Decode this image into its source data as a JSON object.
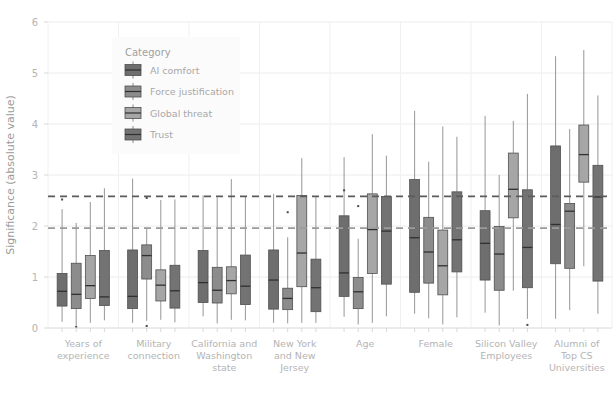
{
  "chart_data": {
    "type": "box",
    "title": "",
    "xlabel": "",
    "ylabel": "Significance (absolute value)",
    "ylim": [
      0,
      6
    ],
    "yticks": [
      0,
      1,
      2,
      3,
      4,
      5,
      6
    ],
    "ytick_labels": [
      "0",
      "1",
      "2",
      "3",
      "4",
      "5",
      "6"
    ],
    "grid": "horizontal-and-vertical-light",
    "legend_position": "upper-left-inside",
    "legend_title": "Category",
    "reference_lines": [
      {
        "value": 2.58,
        "style": "dashed",
        "color": "#5b5b5b",
        "label": ""
      },
      {
        "value": 1.96,
        "style": "dashed",
        "color": "#9a9a9a",
        "label": ""
      }
    ],
    "categories": [
      "Years of experience",
      "Military connection",
      "California and Washington state",
      "New York and New Jersey",
      "Age",
      "Female",
      "Silicon Valley Employees",
      "Alumni of Top CS Universities"
    ],
    "category_label_lines": [
      [
        "Years of",
        "experience"
      ],
      [
        "Military",
        "connection"
      ],
      [
        "California and",
        "Washington",
        "state"
      ],
      [
        "New York",
        "and New",
        "Jersey"
      ],
      [
        "Age"
      ],
      [
        "Female"
      ],
      [
        "Silicon Valley",
        "Employees"
      ],
      [
        "Alumni of",
        "Top CS",
        "Universities"
      ]
    ],
    "series": [
      {
        "name": "AI comfort",
        "color": "#6e6e6e",
        "boxes": [
          {
            "low": 0.12,
            "q1": 0.43,
            "med": 0.72,
            "q3": 1.07,
            "high": 2.33,
            "outliers": [
              2.52
            ]
          },
          {
            "low": 0.1,
            "q1": 0.38,
            "med": 0.62,
            "q3": 1.53,
            "high": 2.93,
            "outliers": []
          },
          {
            "low": 0.23,
            "q1": 0.5,
            "med": 0.89,
            "q3": 1.52,
            "high": 2.6,
            "outliers": []
          },
          {
            "low": 0.1,
            "q1": 0.37,
            "med": 0.94,
            "q3": 1.53,
            "high": 2.63,
            "outliers": []
          },
          {
            "low": 0.22,
            "q1": 0.62,
            "med": 1.08,
            "q3": 2.2,
            "high": 3.35,
            "outliers": [
              2.7
            ]
          },
          {
            "low": 0.28,
            "q1": 0.7,
            "med": 1.77,
            "q3": 2.91,
            "high": 4.26,
            "outliers": []
          },
          {
            "low": 0.3,
            "q1": 0.94,
            "med": 1.66,
            "q3": 2.3,
            "high": 4.16,
            "outliers": []
          },
          {
            "low": 0.18,
            "q1": 1.26,
            "med": 2.03,
            "q3": 3.57,
            "high": 5.33,
            "outliers": []
          }
        ]
      },
      {
        "name": "Force justification",
        "color": "#8c8c8c",
        "boxes": [
          {
            "low": 0.04,
            "q1": 0.38,
            "med": 0.66,
            "q3": 1.27,
            "high": 2.06,
            "outliers": [
              0.02
            ]
          },
          {
            "low": 0.14,
            "q1": 0.96,
            "med": 1.42,
            "q3": 1.63,
            "high": 1.96,
            "outliers": [
              2.55,
              0.04
            ]
          },
          {
            "low": 0.09,
            "q1": 0.49,
            "med": 0.74,
            "q3": 1.19,
            "high": 2.56,
            "outliers": []
          },
          {
            "low": 0.09,
            "q1": 0.36,
            "med": 0.58,
            "q3": 0.78,
            "high": 1.78,
            "outliers": [
              2.27
            ]
          },
          {
            "low": 0.07,
            "q1": 0.38,
            "med": 0.71,
            "q3": 0.99,
            "high": 1.75,
            "outliers": [
              2.39
            ]
          },
          {
            "low": 0.19,
            "q1": 0.88,
            "med": 1.49,
            "q3": 2.17,
            "high": 3.26,
            "outliers": []
          },
          {
            "low": 0.05,
            "q1": 0.74,
            "med": 1.45,
            "q3": 1.99,
            "high": 3.0,
            "outliers": []
          },
          {
            "low": 0.35,
            "q1": 1.17,
            "med": 2.29,
            "q3": 2.44,
            "high": 3.9,
            "outliers": []
          }
        ]
      },
      {
        "name": "Global threat",
        "color": "#a6a6a6",
        "boxes": [
          {
            "low": 0.1,
            "q1": 0.58,
            "med": 0.83,
            "q3": 1.42,
            "high": 2.47,
            "outliers": []
          },
          {
            "low": 0.16,
            "q1": 0.53,
            "med": 0.84,
            "q3": 1.14,
            "high": 2.51,
            "outliers": []
          },
          {
            "low": 0.16,
            "q1": 0.67,
            "med": 0.93,
            "q3": 1.2,
            "high": 2.92,
            "outliers": []
          },
          {
            "low": 0.1,
            "q1": 0.81,
            "med": 1.47,
            "q3": 2.6,
            "high": 3.33,
            "outliers": []
          },
          {
            "low": 0.1,
            "q1": 1.07,
            "med": 1.93,
            "q3": 2.63,
            "high": 3.8,
            "outliers": []
          },
          {
            "low": 0.07,
            "q1": 0.65,
            "med": 1.22,
            "q3": 1.92,
            "high": 3.95,
            "outliers": []
          },
          {
            "low": 0.73,
            "q1": 2.16,
            "med": 2.72,
            "q3": 3.43,
            "high": 4.06,
            "outliers": []
          },
          {
            "low": 1.21,
            "q1": 2.86,
            "med": 3.4,
            "q3": 3.98,
            "high": 5.45,
            "outliers": []
          }
        ]
      },
      {
        "name": "Trust",
        "color": "#737373",
        "boxes": [
          {
            "low": 0.15,
            "q1": 0.44,
            "med": 0.61,
            "q3": 1.52,
            "high": 2.74,
            "outliers": []
          },
          {
            "low": 0.11,
            "q1": 0.39,
            "med": 0.73,
            "q3": 1.23,
            "high": 2.52,
            "outliers": []
          },
          {
            "low": 0.15,
            "q1": 0.46,
            "med": 0.82,
            "q3": 1.43,
            "high": 2.58,
            "outliers": []
          },
          {
            "low": 0.1,
            "q1": 0.32,
            "med": 0.79,
            "q3": 1.35,
            "high": 2.57,
            "outliers": []
          },
          {
            "low": 0.23,
            "q1": 0.86,
            "med": 1.9,
            "q3": 2.58,
            "high": 3.38,
            "outliers": []
          },
          {
            "low": 0.21,
            "q1": 1.1,
            "med": 1.73,
            "q3": 2.67,
            "high": 3.75,
            "outliers": []
          },
          {
            "low": 0.18,
            "q1": 0.79,
            "med": 1.58,
            "q3": 2.71,
            "high": 4.59,
            "outliers": [
              0.06
            ]
          },
          {
            "low": 0.28,
            "q1": 0.92,
            "med": 2.57,
            "q3": 3.19,
            "high": 4.56,
            "outliers": []
          }
        ]
      }
    ]
  }
}
